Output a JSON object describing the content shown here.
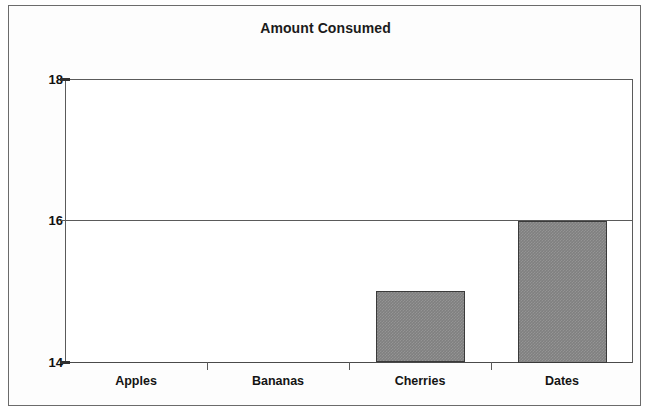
{
  "chart_data": {
    "type": "bar",
    "title": "Amount Consumed",
    "xlabel": "",
    "ylabel": "",
    "categories": [
      "Apples",
      "Bananas",
      "Cherries",
      "Dates"
    ],
    "values": [
      14,
      14,
      15,
      16
    ],
    "ylim": [
      14,
      18
    ],
    "yticks": [
      14,
      16,
      18
    ],
    "ytick_labels": [
      "14",
      "16",
      "18"
    ],
    "grid": true,
    "gridlines_y": [
      16,
      18
    ],
    "legend": null,
    "legend_position": "none",
    "bar_fill_color": "#808080",
    "bar_border_color": "#3a3a3a",
    "plot_background_color": "#ffffff",
    "frame_border_color": "#6b6b6b",
    "axis_color": "#5a5a5a",
    "text_color": "#111111"
  },
  "axis": {
    "y": {
      "tick_18": "18",
      "tick_16": "16",
      "tick_14": "14"
    },
    "x": {
      "cat_0": "Apples",
      "cat_1": "Bananas",
      "cat_2": "Cherries",
      "cat_3": "Dates"
    }
  },
  "title": {
    "text": "Amount Consumed"
  }
}
